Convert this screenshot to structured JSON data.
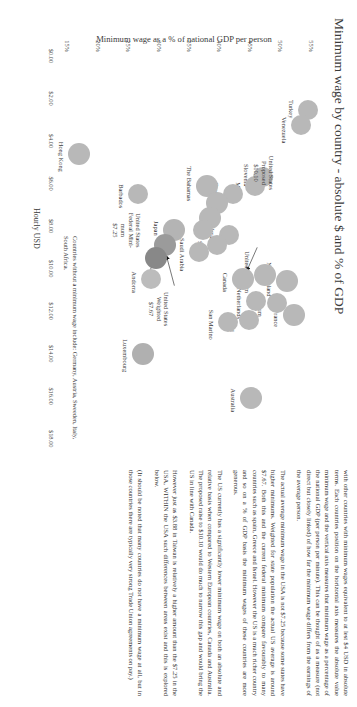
{
  "chart_data": {
    "type": "scatter",
    "title": "Minimum wage by country - absolute $ and % of GDP",
    "xlabel": "Hourly USD",
    "ylabel": "Minimum wage as a % of national GDP per person",
    "xlim": [
      0,
      19
    ],
    "ylim": [
      13,
      57
    ],
    "xticks": [
      "$0.00",
      "$2.00",
      "$4.00",
      "$6.00",
      "$8.00",
      "$10.00",
      "$12.00",
      "$14.00",
      "$16.00",
      "$18.00"
    ],
    "xtickvals": [
      0,
      2,
      4,
      6,
      8,
      10,
      12,
      14,
      16,
      18
    ],
    "yticks": [
      "15%",
      "20%",
      "25%",
      "30%",
      "35%",
      "40%",
      "45%",
      "50%",
      "55%"
    ],
    "ytickvals": [
      15,
      20,
      25,
      30,
      35,
      40,
      45,
      50,
      55
    ],
    "grid": false,
    "legend": "none",
    "points": [
      {
        "name": "Turkey",
        "x": 2.55,
        "y": 54.6,
        "r": 10,
        "color": "#b8b8b8",
        "label_dx": -1,
        "label_dy": 13
      },
      {
        "name": "Venezuela",
        "x": 3.25,
        "y": 53.4,
        "r": 10,
        "color": "#b8b8b8",
        "label_dx": 5,
        "label_dy": 13
      },
      {
        "name": "New Zealand",
        "x": 10.6,
        "y": 51.1,
        "r": 11,
        "color": "#b8b8b8",
        "label_dx": -2,
        "label_dy": 14
      },
      {
        "name": "France",
        "x": 12.2,
        "y": 52.2,
        "r": 11,
        "color": "#b8b8b8",
        "label_dx": 3,
        "label_dy": 14
      },
      {
        "name": "Belgium",
        "x": 11.6,
        "y": 49.4,
        "r": 10,
        "color": "#b8b8b8",
        "label_dx": 3,
        "label_dy": 13
      },
      {
        "name": "United kingdom",
        "x": 10.3,
        "y": 47.4,
        "r": 11,
        "color": "#b8b8b8",
        "label_dx": -3,
        "label_dy": 14
      },
      {
        "name": "Netherlands",
        "x": 11.5,
        "y": 46.0,
        "r": 10,
        "color": "#b8b8b8",
        "label_dx": 3,
        "label_dy": 13
      },
      {
        "name": "Ireland",
        "x": 12.4,
        "y": 44.8,
        "r": 10,
        "color": "#b8b8b8",
        "label_dx": 3,
        "label_dy": 13
      },
      {
        "name": "Canada",
        "x": 10.5,
        "y": 43.9,
        "r": 11,
        "color": "#b8b8b8",
        "label_dx": 3,
        "label_dy": 14
      },
      {
        "name": "San Marino",
        "x": 12.5,
        "y": 41.4,
        "r": 10,
        "color": "#b8b8b8",
        "label_dx": 3,
        "label_dy": 13
      },
      {
        "name": "Australia",
        "x": 16.1,
        "y": 45.2,
        "r": 11,
        "color": "#b8b8b8",
        "label_dx": 2,
        "label_dy": 14
      },
      {
        "name": "Luxembourg",
        "x": 14.0,
        "y": 27.4,
        "r": 11,
        "color": "#b0b0b0",
        "label_dx": 2,
        "label_dy": 14
      },
      {
        "name": "Slovenia",
        "x": 5.7,
        "y": 47.2,
        "r": 10,
        "color": "#b8b8b8",
        "label_dx": -2,
        "label_dy": 13
      },
      {
        "name": "Malta",
        "x": 6.1,
        "y": 45.9,
        "r": 10,
        "color": "#b8b8b8",
        "label_dx": 4,
        "label_dy": 13
      },
      {
        "name": "Greece",
        "x": 6.5,
        "y": 42.3,
        "r": 10,
        "color": "#b8b8b8",
        "label_dx": -3,
        "label_dy": 13
      },
      {
        "name": "Israel",
        "x": 8.4,
        "y": 41.6,
        "r": 10,
        "color": "#b8b8b8",
        "label_dx": 1,
        "label_dy": 13
      },
      {
        "name": "Spain",
        "x": 8.9,
        "y": 39.6,
        "r": 10,
        "color": "#b8b8b8",
        "label_dx": 3,
        "label_dy": 13
      },
      {
        "name": "The Bahamas",
        "x": 6.1,
        "y": 38.0,
        "r": 11,
        "color": "#b8b8b8",
        "label_dx": -2,
        "label_dy": 14
      },
      {
        "name": "",
        "x": 6.9,
        "y": 39.6,
        "r": 11,
        "color": "#b8b8b8",
        "label_dx": 0,
        "label_dy": 0
      },
      {
        "name": "",
        "x": 7.6,
        "y": 38.5,
        "r": 11,
        "color": "#b8b8b8",
        "label_dx": 0,
        "label_dy": 0
      },
      {
        "name": "",
        "x": 8.2,
        "y": 37.3,
        "r": 10,
        "color": "#b8b8b8",
        "label_dx": 0,
        "label_dy": 0
      },
      {
        "name": "Saudi Arabia",
        "x": 9.2,
        "y": 36.6,
        "r": 10,
        "color": "#b8b8b8",
        "label_dx": 3,
        "label_dy": 13
      },
      {
        "name": "Barbados",
        "x": 6.5,
        "y": 26.7,
        "r": 10,
        "color": "#b8b8b8",
        "label_dx": 2,
        "label_dy": 13
      },
      {
        "name": "Japan",
        "x": 8.2,
        "y": 32.6,
        "r": 11,
        "color": "#b4b4b4",
        "label_dx": -2,
        "label_dy": 14
      },
      {
        "name": "",
        "x": 8.9,
        "y": 31.0,
        "r": 11,
        "color": "#9b9b9b",
        "label_dx": 0,
        "label_dy": 0
      },
      {
        "name": "",
        "x": 9.5,
        "y": 29.6,
        "r": 11,
        "color": "#888888",
        "label_dx": 0,
        "label_dy": 0
      },
      {
        "name": "Andorra",
        "x": 10.5,
        "y": 28.8,
        "r": 10,
        "color": "#bcbcbc",
        "label_dx": 3,
        "label_dy": 13
      },
      {
        "name": "Hong Kong",
        "x": 4.6,
        "y": 17.0,
        "r": 11,
        "color": "#b8b8b8",
        "label_dx": 3,
        "label_dy": 14
      }
    ],
    "callouts": [
      {
        "name": "us-proposed",
        "text": "United States\nProposed\n$10.10",
        "x": 5.5,
        "y": 49.2
      },
      {
        "name": "us-weighted",
        "text": "United States\nWeighted\n$7.67",
        "x": 11.9,
        "y": 31.9
      },
      {
        "name": "us-federal",
        "text": "United States\nFederal Mini-\nmum\n$7.25",
        "x": 8.2,
        "y": 27.3
      }
    ],
    "arrows": [
      {
        "name": "arrow-to-canada",
        "x1": 9.0,
        "y1": 46.2,
        "x2": 10.1,
        "y2": 44.5
      },
      {
        "name": "arrow-to-weighted",
        "x1": 10.8,
        "y1": 32.6,
        "x2": 9.4,
        "y2": 31.3
      },
      {
        "name": "arrow-to-federal",
        "x1": 10.4,
        "y1": 28.1,
        "x2": 9.7,
        "y2": 29.2
      }
    ],
    "footnote": "Countries without a minimum wage include: Germany, Austria, Sweeden, Italy, South Africa."
  },
  "text_column": {
    "paragraphs": [
      "with other countries with minimum wages equivalent to at lest $4 USD in absolute terms. Each countries position on the horizontal axis measures the absolute value minimum wage and the vertical axis measures that minimum wage as a percentage of the national GDP (per person per minute). This can be thought of as a measure (not direct but closely linked) of how far the minimum wage differs from the earnings of the average person.",
      "The actual average minimum wage in the USA is not $7.25 because some states have higher minimums. Weighted for state population the actual US average is around $7.67. Both this and the current federal minimum compare favourably to many countries such as spain, Greece and Israel. However the US is a much richer country and so on a % of GDP basis the minimum wages of these countries are more generous.",
      "The US currently has a significantly lower minimum wage on both an absolute and relative basis when compared to Western European countries, Canada and Australia. The proposed raise to $10.10 would do much to narrow this gap and would bring the US in line with Canada.",
      "However just as $3.88 in Taiwan is relatively a higher amount  than the $7.25 in the USA, WITHIN the USA such differences between areas exist and this is explored below.",
      "(It should be noted that many countries do not have a minimum wage at all, but in those countries there are typically very strong Trade Union agreements on pay.)"
    ]
  }
}
